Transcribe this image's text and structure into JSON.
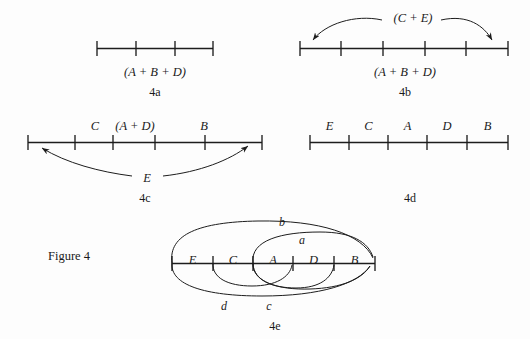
{
  "figure": {
    "caption": "Figure 4",
    "panels": [
      {
        "id": "4a",
        "label": "4a",
        "segment_label": "(A + B + D)",
        "tick_count": 4
      },
      {
        "id": "4b",
        "label": "4b",
        "segment_label": "(A + B + D)",
        "arrow_label": "(C + E)",
        "tick_count": 6
      },
      {
        "id": "4c",
        "label": "4c",
        "top_labels": [
          "C",
          "(A + D)",
          "B"
        ],
        "arrow_label": "E",
        "tick_count": 6
      },
      {
        "id": "4d",
        "label": "4d",
        "top_labels": [
          "E",
          "C",
          "A",
          "D",
          "B"
        ],
        "tick_count": 6
      },
      {
        "id": "4e",
        "label": "4e",
        "interval_labels": [
          "E",
          "C",
          "A",
          "D",
          "B"
        ],
        "arc_labels": {
          "above_outer": "b",
          "above_inner": "a",
          "below_left": "d",
          "below_right": "c"
        },
        "tick_count": 6
      }
    ]
  },
  "colors": {
    "ink": "#1d1d1d",
    "background": "#fdfdfd"
  }
}
